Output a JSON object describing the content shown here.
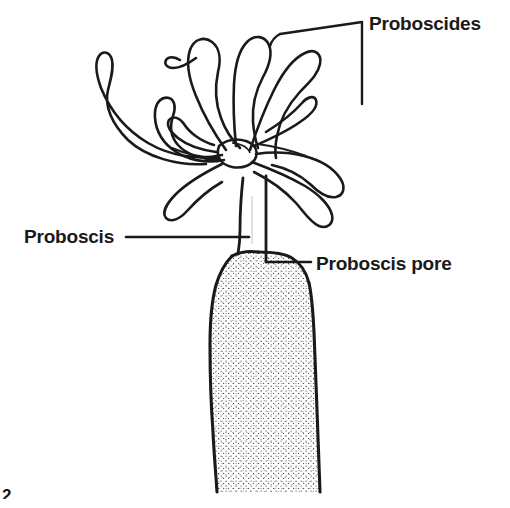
{
  "figure": {
    "kind": "biological-line-drawing",
    "subject": "proboscides",
    "background_color": "#ffffff",
    "ink_color": "#1a1a1a",
    "stipple_color": "#555555",
    "width": 510,
    "height": 508
  },
  "labels": {
    "proboscides": "Proboscides",
    "proboscis": "Proboscis",
    "proboscis_pore": "Proboscis pore"
  },
  "caption": {
    "figure_number": "2"
  },
  "annotations": {
    "bracket_note": "square bracket enclosing the tentacle crown",
    "leader_proboscis": "horizontal leader line to stalk",
    "leader_pore": "horizontal leader line to stalk base"
  }
}
